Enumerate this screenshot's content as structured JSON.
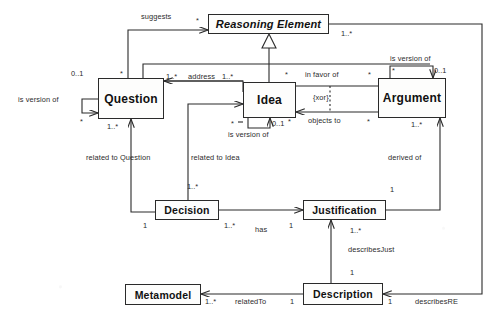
{
  "diagram": {
    "type": "uml-class-diagram",
    "stroke_color": "#2a2a2a",
    "fill_color": "#fdfdfc",
    "classes": [
      {
        "id": "reasoning_element",
        "name": "Reasoning Element",
        "abstract": true,
        "x": 208,
        "y": 14,
        "w": 121,
        "h": 20,
        "font_size": 11
      },
      {
        "id": "question",
        "name": "Question",
        "abstract": false,
        "x": 98,
        "y": 78,
        "w": 66,
        "h": 41,
        "font_size": 12
      },
      {
        "id": "idea",
        "name": "Idea",
        "abstract": false,
        "x": 243,
        "y": 82,
        "w": 53,
        "h": 36,
        "font_size": 12
      },
      {
        "id": "argument",
        "name": "Argument",
        "abstract": false,
        "x": 378,
        "y": 78,
        "w": 68,
        "h": 40,
        "font_size": 12
      },
      {
        "id": "decision",
        "name": "Decision",
        "abstract": false,
        "x": 155,
        "y": 200,
        "w": 64,
        "h": 20,
        "font_size": 10.5
      },
      {
        "id": "justification",
        "name": "Justification",
        "abstract": false,
        "x": 303,
        "y": 200,
        "w": 83,
        "h": 20,
        "font_size": 10.5
      },
      {
        "id": "metamodel",
        "name": "Metamodel",
        "abstract": false,
        "x": 125,
        "y": 284,
        "w": 76,
        "h": 21,
        "font_size": 10.5
      },
      {
        "id": "description",
        "name": "Description",
        "abstract": false,
        "x": 303,
        "y": 283,
        "w": 80,
        "h": 22,
        "font_size": 10.5
      }
    ],
    "association_labels": [
      {
        "id": "suggests",
        "text": "suggests",
        "x": 141,
        "y": 12
      },
      {
        "id": "address",
        "text": "address",
        "x": 188,
        "y": 72
      },
      {
        "id": "in_favor_of",
        "text": "in favor of",
        "x": 305,
        "y": 70
      },
      {
        "id": "xor_constraint",
        "text": "{xor}",
        "x": 313,
        "y": 93
      },
      {
        "id": "objects_to",
        "text": "objects to",
        "x": 308,
        "y": 116
      },
      {
        "id": "is_version_of_question",
        "text": "is version of",
        "x": 18,
        "y": 95
      },
      {
        "id": "is_version_of_idea",
        "text": "is version of",
        "x": 228,
        "y": 130
      },
      {
        "id": "is_version_of_argument",
        "text": "is version of",
        "x": 390,
        "y": 54
      },
      {
        "id": "related_to_question",
        "text": "related to Question",
        "x": 86,
        "y": 153
      },
      {
        "id": "related_to_idea",
        "text": "related to Idea",
        "x": 191,
        "y": 153
      },
      {
        "id": "derived_of",
        "text": "derived of",
        "x": 388,
        "y": 153
      },
      {
        "id": "has",
        "text": "has",
        "x": 255,
        "y": 225
      },
      {
        "id": "describes_just",
        "text": "describesJust",
        "x": 348,
        "y": 245
      },
      {
        "id": "related_to",
        "text": "relatedTo",
        "x": 235,
        "y": 297
      },
      {
        "id": "describes_re",
        "text": "describesRE",
        "x": 415,
        "y": 297
      }
    ],
    "multiplicities": [
      {
        "id": "m_re_left",
        "text": "*",
        "x": 196,
        "y": 16
      },
      {
        "id": "m_re_right",
        "text": "1..*",
        "x": 341,
        "y": 29
      },
      {
        "id": "m_question_left",
        "text": "0..1",
        "x": 71,
        "y": 69
      },
      {
        "id": "m_question_loop",
        "text": "*",
        "x": 80,
        "y": 117
      },
      {
        "id": "m_question_top",
        "text": "*",
        "x": 120,
        "y": 69
      },
      {
        "id": "m_question_addr",
        "text": "1..*",
        "x": 166,
        "y": 72
      },
      {
        "id": "m_idea_addr",
        "text": "1..*",
        "x": 222,
        "y": 72
      },
      {
        "id": "m_question_bot",
        "text": "1..*",
        "x": 107,
        "y": 122
      },
      {
        "id": "m_idea_favor_l",
        "text": "*",
        "x": 285,
        "y": 70
      },
      {
        "id": "m_arg_favor_r",
        "text": "*",
        "x": 368,
        "y": 70
      },
      {
        "id": "m_idea_objects_l",
        "text": "*",
        "x": 288,
        "y": 117
      },
      {
        "id": "m_arg_objects_r",
        "text": "*",
        "x": 367,
        "y": 117
      },
      {
        "id": "m_idea_loop_l",
        "text": "*",
        "x": 231,
        "y": 119
      },
      {
        "id": "m_idea_loop_r",
        "text": "0..1",
        "x": 272,
        "y": 119
      },
      {
        "id": "m_arg_loop_l",
        "text": "*",
        "x": 392,
        "y": 66
      },
      {
        "id": "m_arg_loop_r",
        "text": "0..1",
        "x": 434,
        "y": 66
      },
      {
        "id": "m_arg_bottom",
        "text": "1..*",
        "x": 411,
        "y": 120
      },
      {
        "id": "m_decision_top",
        "text": "1..*",
        "x": 187,
        "y": 182
      },
      {
        "id": "m_decision_left",
        "text": "1",
        "x": 143,
        "y": 221
      },
      {
        "id": "m_decision_has",
        "text": "1..*",
        "x": 224,
        "y": 221
      },
      {
        "id": "m_just_has",
        "text": "1",
        "x": 289,
        "y": 221
      },
      {
        "id": "m_just_derived",
        "text": "1",
        "x": 390,
        "y": 185
      },
      {
        "id": "m_just_desc",
        "text": "1..*",
        "x": 350,
        "y": 226
      },
      {
        "id": "m_desc_just",
        "text": "1",
        "x": 350,
        "y": 268
      },
      {
        "id": "m_meta_rel",
        "text": "1..*",
        "x": 205,
        "y": 297
      },
      {
        "id": "m_desc_rel",
        "text": "1",
        "x": 290,
        "y": 297
      },
      {
        "id": "m_desc_re",
        "text": "1",
        "x": 388,
        "y": 297
      }
    ]
  }
}
